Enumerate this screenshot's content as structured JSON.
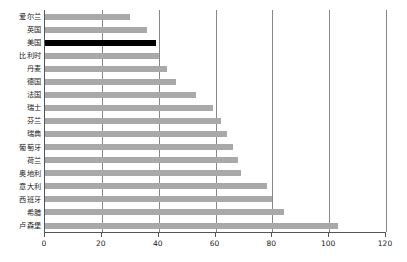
{
  "chart_data": {
    "type": "bar",
    "orientation": "horizontal",
    "title": "",
    "subtitle": "",
    "xlabel": "",
    "ylabel": "",
    "xlim": [
      0,
      120
    ],
    "xticks": [
      0,
      20,
      40,
      60,
      80,
      100,
      120
    ],
    "grid": true,
    "legend": null,
    "highlight_category": "美国",
    "colors": {
      "bar": "#a9a9a9",
      "highlight": "#000000",
      "axis": "#555555",
      "gridline": "#888888",
      "text": "#1a1a1a",
      "background": "#ffffff"
    },
    "categories": [
      "爱尔兰",
      "英国",
      "美国",
      "比利时",
      "丹麦",
      "德国",
      "法国",
      "瑞士",
      "芬兰",
      "瑞典",
      "葡萄牙",
      "荷兰",
      "奥地利",
      "意大利",
      "西班牙",
      "希腊",
      "卢森堡"
    ],
    "values": [
      30,
      36,
      39,
      40,
      43,
      46,
      53,
      59,
      62,
      64,
      66,
      68,
      69,
      78,
      80,
      84,
      103
    ]
  }
}
